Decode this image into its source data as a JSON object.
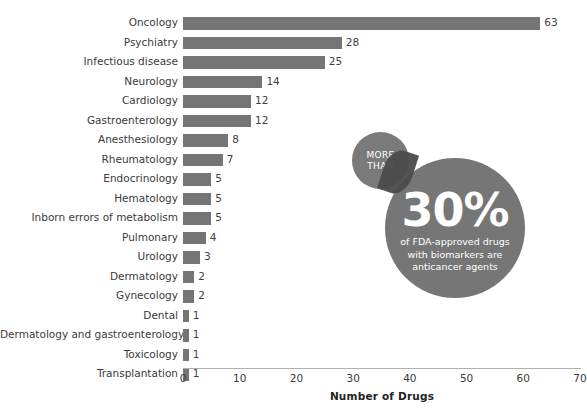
{
  "chart_data": {
    "type": "bar",
    "orientation": "horizontal",
    "title": "",
    "xlabel": "Number of Drugs",
    "ylabel": "",
    "xlim": [
      0,
      70
    ],
    "xticks": [
      0,
      10,
      20,
      30,
      40,
      50,
      60,
      70
    ],
    "grid": false,
    "legend": "none",
    "bar_color": "#757575",
    "categories": [
      "Oncology",
      "Psychiatry",
      "Infectious disease",
      "Neurology",
      "Cardiology",
      "Gastroenterology",
      "Anesthesiology",
      "Rheumatology",
      "Endocrinology",
      "Hematology",
      "Inborn errors of metabolism",
      "Pulmonary",
      "Urology",
      "Dermatology",
      "Gynecology",
      "Dental",
      "Dermatology and gastroenterology",
      "Toxicology",
      "Transplantation"
    ],
    "values": [
      63,
      28,
      25,
      14,
      12,
      12,
      8,
      7,
      5,
      5,
      5,
      4,
      3,
      2,
      2,
      1,
      1,
      1,
      1
    ],
    "annotations": [
      {
        "name": "more-than-30-percent-callout",
        "badge_line1": "MORE",
        "badge_line2": "THAN",
        "headline": "30%",
        "body": "of FDA-approved drugs with biomarkers are anticancer agents",
        "color": "#767676"
      }
    ]
  },
  "axis": {
    "x_title": "Number of Drugs",
    "x_tick_labels": [
      "0",
      "10",
      "20",
      "30",
      "40",
      "50",
      "60",
      "70"
    ]
  },
  "callout": {
    "badge_line1": "MORE",
    "badge_line2": "THAN",
    "percent": "30%",
    "body_line1": "of FDA-approved drugs",
    "body_line2": "with biomarkers are",
    "body_line3": "anticancer agents"
  },
  "clipped_title": ""
}
